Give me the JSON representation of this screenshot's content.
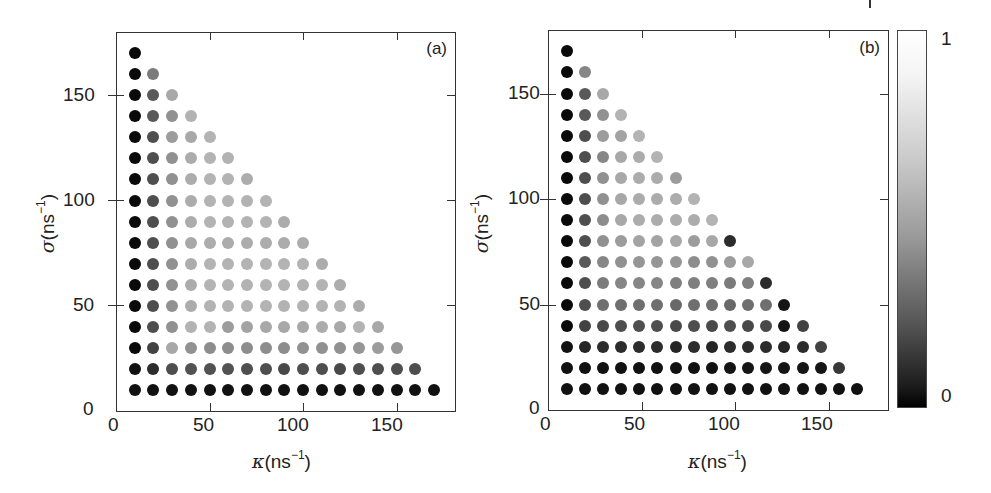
{
  "figure": {
    "panels": [
      {
        "id": "a",
        "label": "(a)",
        "xlabel_sym": "κ",
        "xlabel_unit": "(ns",
        "xlabel_exp": "−1",
        "xlabel_close": ")",
        "ylabel_sym": "σ",
        "ylabel_unit": "(ns",
        "ylabel_exp": "−1",
        "ylabel_close": ")",
        "xticks": [
          "0",
          "50",
          "100",
          "150"
        ],
        "yticks": [
          "0",
          "50",
          "100",
          "150"
        ]
      },
      {
        "id": "b",
        "label": "(b)",
        "xlabel_sym": "κ",
        "xlabel_unit": "(ns",
        "xlabel_exp": "−1",
        "xlabel_close": ")",
        "ylabel_sym": "σ",
        "ylabel_unit": "(ns",
        "ylabel_exp": "−1",
        "ylabel_close": ")",
        "xticks": [
          "0",
          "50",
          "100",
          "150"
        ],
        "yticks": [
          "0",
          "50",
          "100",
          "150"
        ]
      }
    ],
    "colorbar": {
      "max_label": "1",
      "min_label": "0",
      "colors": [
        "#000000",
        "#ffffff"
      ]
    }
  },
  "chart_data": [
    {
      "type": "scatter",
      "title": "(a)",
      "xlabel": "κ(ns⁻¹)",
      "ylabel": "σ(ns⁻¹)",
      "xlim": [
        0,
        180
      ],
      "ylim": [
        0,
        180
      ],
      "xticks": [
        0,
        50,
        100,
        150
      ],
      "yticks": [
        0,
        50,
        100,
        150
      ],
      "grid": false,
      "colorscale": "gray, 0 = black, 1 = white",
      "grid_points": "κ = 10..170 step 10, σ = 10..170 step 10, κ + σ ≤ 180",
      "x_step": 10,
      "rows": [
        {
          "sigma": 170,
          "values": [
            0.0
          ]
        },
        {
          "sigma": 160,
          "values": [
            0.0,
            0.5
          ]
        },
        {
          "sigma": 150,
          "values": [
            0.0,
            0.35,
            0.7
          ]
        },
        {
          "sigma": 140,
          "values": [
            0.0,
            0.35,
            0.6,
            0.75
          ]
        },
        {
          "sigma": 130,
          "values": [
            0.0,
            0.3,
            0.65,
            0.7,
            0.75
          ]
        },
        {
          "sigma": 120,
          "values": [
            0.0,
            0.3,
            0.6,
            0.72,
            0.75,
            0.75
          ]
        },
        {
          "sigma": 110,
          "values": [
            0.0,
            0.3,
            0.6,
            0.72,
            0.75,
            0.75,
            0.72
          ]
        },
        {
          "sigma": 100,
          "values": [
            0.0,
            0.3,
            0.6,
            0.72,
            0.75,
            0.75,
            0.75,
            0.75
          ]
        },
        {
          "sigma": 90,
          "values": [
            0.0,
            0.3,
            0.6,
            0.72,
            0.75,
            0.75,
            0.75,
            0.75,
            0.72
          ]
        },
        {
          "sigma": 80,
          "values": [
            0.0,
            0.3,
            0.6,
            0.7,
            0.72,
            0.72,
            0.72,
            0.72,
            0.72,
            0.72
          ]
        },
        {
          "sigma": 70,
          "values": [
            0.0,
            0.3,
            0.6,
            0.72,
            0.75,
            0.75,
            0.75,
            0.75,
            0.75,
            0.75,
            0.72
          ]
        },
        {
          "sigma": 60,
          "values": [
            0.0,
            0.3,
            0.6,
            0.72,
            0.75,
            0.75,
            0.75,
            0.75,
            0.75,
            0.75,
            0.75,
            0.72
          ]
        },
        {
          "sigma": 50,
          "values": [
            0.0,
            0.3,
            0.6,
            0.72,
            0.75,
            0.75,
            0.75,
            0.75,
            0.75,
            0.75,
            0.75,
            0.75,
            0.72
          ]
        },
        {
          "sigma": 40,
          "values": [
            0.0,
            0.3,
            0.6,
            0.75,
            0.75,
            0.65,
            0.68,
            0.7,
            0.7,
            0.7,
            0.72,
            0.7,
            0.75,
            0.7
          ]
        },
        {
          "sigma": 30,
          "values": [
            0.0,
            0.25,
            0.7,
            0.6,
            0.58,
            0.58,
            0.58,
            0.58,
            0.58,
            0.6,
            0.6,
            0.6,
            0.62,
            0.65,
            0.62
          ]
        },
        {
          "sigma": 20,
          "values": [
            0.03,
            0.15,
            0.3,
            0.32,
            0.32,
            0.32,
            0.3,
            0.3,
            0.28,
            0.3,
            0.3,
            0.28,
            0.3,
            0.3,
            0.3,
            0.3
          ]
        },
        {
          "sigma": 10,
          "values": [
            0.03,
            0.03,
            0.03,
            0.03,
            0.03,
            0.03,
            0.03,
            0.03,
            0.03,
            0.03,
            0.03,
            0.03,
            0.03,
            0.03,
            0.03,
            0.03,
            0.03
          ]
        }
      ]
    },
    {
      "type": "scatter",
      "title": "(b)",
      "xlabel": "κ(ns⁻¹)",
      "ylabel": "σ(ns⁻¹)",
      "xlim": [
        0,
        180
      ],
      "ylim": [
        0,
        180
      ],
      "xticks": [
        0,
        50,
        100,
        150
      ],
      "yticks": [
        0,
        50,
        100,
        150
      ],
      "grid": false,
      "colorscale": "gray, 0 = black, 1 = white",
      "grid_points": "κ ≈ 10..165 (spacing ≈ 9.7), σ = 10..170 step 10, triangular region",
      "x_step": 9.7,
      "rows": [
        {
          "sigma": 170,
          "values": [
            0.0
          ]
        },
        {
          "sigma": 160,
          "values": [
            0.0,
            0.55
          ]
        },
        {
          "sigma": 150,
          "values": [
            0.0,
            0.35,
            0.7
          ]
        },
        {
          "sigma": 140,
          "values": [
            0.0,
            0.35,
            0.6,
            0.75
          ]
        },
        {
          "sigma": 130,
          "values": [
            0.0,
            0.3,
            0.65,
            0.68,
            0.75
          ]
        },
        {
          "sigma": 120,
          "values": [
            0.0,
            0.3,
            0.55,
            0.7,
            0.72,
            0.75
          ]
        },
        {
          "sigma": 110,
          "values": [
            0.0,
            0.3,
            0.6,
            0.7,
            0.72,
            0.72,
            0.65
          ]
        },
        {
          "sigma": 100,
          "values": [
            0.0,
            0.3,
            0.6,
            0.7,
            0.72,
            0.72,
            0.72,
            0.75
          ]
        },
        {
          "sigma": 90,
          "values": [
            0.0,
            0.3,
            0.58,
            0.7,
            0.72,
            0.72,
            0.72,
            0.72,
            0.75
          ]
        },
        {
          "sigma": 80,
          "values": [
            0.0,
            0.3,
            0.6,
            0.65,
            0.68,
            0.68,
            0.7,
            0.65,
            0.7,
            0.15
          ]
        },
        {
          "sigma": 70,
          "values": [
            0.0,
            0.35,
            0.55,
            0.6,
            0.62,
            0.62,
            0.62,
            0.58,
            0.6,
            0.65,
            0.7
          ]
        },
        {
          "sigma": 60,
          "values": [
            0.0,
            0.3,
            0.5,
            0.55,
            0.55,
            0.55,
            0.52,
            0.52,
            0.52,
            0.5,
            0.52,
            0.15
          ]
        },
        {
          "sigma": 50,
          "values": [
            0.0,
            0.3,
            0.45,
            0.45,
            0.45,
            0.45,
            0.42,
            0.45,
            0.45,
            0.42,
            0.45,
            0.45,
            0.05
          ]
        },
        {
          "sigma": 40,
          "values": [
            0.0,
            0.25,
            0.28,
            0.3,
            0.3,
            0.3,
            0.28,
            0.3,
            0.28,
            0.3,
            0.28,
            0.28,
            0.05,
            0.25
          ]
        },
        {
          "sigma": 30,
          "values": [
            0.03,
            0.12,
            0.15,
            0.15,
            0.15,
            0.15,
            0.12,
            0.15,
            0.12,
            0.15,
            0.15,
            0.15,
            0.12,
            0.15,
            0.25
          ]
        },
        {
          "sigma": 20,
          "values": [
            0.03,
            0.03,
            0.03,
            0.03,
            0.03,
            0.03,
            0.03,
            0.03,
            0.03,
            0.05,
            0.05,
            0.05,
            0.05,
            0.05,
            0.05,
            0.2
          ]
        },
        {
          "sigma": 10,
          "values": [
            0.03,
            0.03,
            0.03,
            0.03,
            0.03,
            0.03,
            0.03,
            0.03,
            0.03,
            0.03,
            0.03,
            0.03,
            0.03,
            0.03,
            0.03,
            0.03,
            0.03
          ]
        }
      ]
    }
  ]
}
